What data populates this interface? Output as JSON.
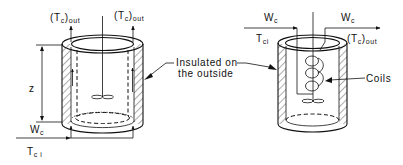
{
  "figure": {
    "type": "diagram"
  },
  "left_vessel": {
    "name": "jacketed-vessel",
    "outlet_label_left": {
      "main": "(T",
      "sub": "c",
      "tail": ")",
      "sub2": "out"
    },
    "outlet_label_right": {
      "main": "(T",
      "sub": "c",
      "tail": ")",
      "sub2": "out"
    },
    "height_label": "z",
    "inlet_flow_label": {
      "main": "W",
      "sub": "c"
    },
    "inlet_temp_label": {
      "main": "T",
      "sub": "c i"
    },
    "insulation_note_line1": "Insulated on",
    "insulation_note_line2": "the outside"
  },
  "right_vessel": {
    "name": "coil-vessel",
    "inlet_flow_label": {
      "main": "W",
      "sub": "c"
    },
    "outlet_flow_label": {
      "main": "W",
      "sub": "c"
    },
    "inlet_temp_label": {
      "main": "T",
      "sub": "ci"
    },
    "outlet_temp_label": {
      "main": "(T",
      "sub": "c",
      "tail": ")",
      "sub2": "out"
    },
    "coils_label": "Coils"
  },
  "colors": {
    "ink": "#111111",
    "background": "#ffffff"
  }
}
